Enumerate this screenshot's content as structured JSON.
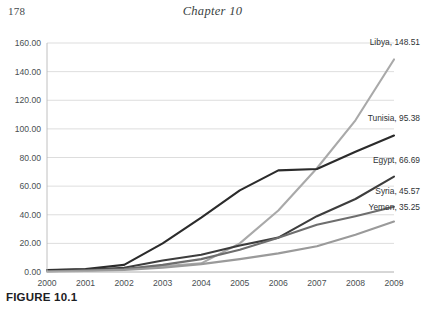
{
  "page": {
    "number": "178",
    "chapter_title": "Chapter 10",
    "figure_caption": "FIGURE 10.1"
  },
  "chart_data": {
    "type": "line",
    "title": "",
    "subtitle": "",
    "xlabel": "",
    "ylabel": "",
    "grid": true,
    "legend_position": "end-of-line-labels",
    "x": [
      "2000",
      "2001",
      "2002",
      "2003",
      "2004",
      "2005",
      "2006",
      "2007",
      "2008",
      "2009"
    ],
    "xlim": [
      "2000",
      "2009"
    ],
    "ylim": [
      0,
      160
    ],
    "ytick_labels": [
      "0.00",
      "20.00",
      "40.00",
      "60.00",
      "80.00",
      "100.00",
      "120.00",
      "140.00",
      "160.00"
    ],
    "ytick_values": [
      0,
      20,
      40,
      60,
      80,
      100,
      120,
      140,
      160
    ],
    "series": [
      {
        "name": "Libya",
        "color": "#a9a9a9",
        "end_label": "Libya, 148.51",
        "end_value": 148.51,
        "values": [
          1.2,
          1.8,
          2.3,
          4.0,
          6.0,
          20.0,
          43.0,
          72.5,
          106.0,
          148.51
        ]
      },
      {
        "name": "Tunisia",
        "color": "#2b2b2b",
        "end_label": "Tunisia, 95.38",
        "end_value": 95.38,
        "values": [
          1.3,
          2.1,
          5.0,
          20.0,
          38.0,
          57.0,
          71.0,
          72.0,
          84.0,
          95.38
        ]
      },
      {
        "name": "Egypt",
        "color": "#3d3d3d",
        "end_label": "Egypt, 66.69",
        "end_value": 66.69,
        "values": [
          0.9,
          1.5,
          3.0,
          8.0,
          12.0,
          18.5,
          24.0,
          39.0,
          51.0,
          66.69
        ]
      },
      {
        "name": "Syria",
        "color": "#6e6e6e",
        "end_label": "Syria, 45.57",
        "end_value": 45.57,
        "values": [
          0.5,
          1.0,
          2.0,
          5.0,
          9.0,
          15.5,
          24.0,
          33.0,
          39.0,
          45.57
        ]
      },
      {
        "name": "Yemen",
        "color": "#9a9a9a",
        "end_label": "Yemen, 35.25",
        "end_value": 35.25,
        "values": [
          0.4,
          0.8,
          1.5,
          3.0,
          5.5,
          9.0,
          13.0,
          18.0,
          26.0,
          35.25
        ]
      }
    ]
  },
  "colors": {
    "axis": "#b9b9b9",
    "grid": "#cfcfcf",
    "text": "#4a4f52"
  }
}
